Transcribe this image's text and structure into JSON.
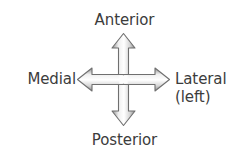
{
  "diagram": {
    "background_color": "#ffffff",
    "text_color": "#3c3c3c",
    "arrow_outline_color": "#6f6f6f",
    "arrow_fill_light": "#ffffff",
    "arrow_fill_shadow": "#9a9a9a",
    "labels": {
      "anterior": "Anterior",
      "posterior": "Posterior",
      "medial": "Medial",
      "lateral": "Lateral",
      "lateral_qualifier": "(left)"
    },
    "arrow_icon": {
      "name": "four-way-cross-arrow-icon",
      "directions": [
        "up",
        "down",
        "left",
        "right"
      ]
    }
  }
}
